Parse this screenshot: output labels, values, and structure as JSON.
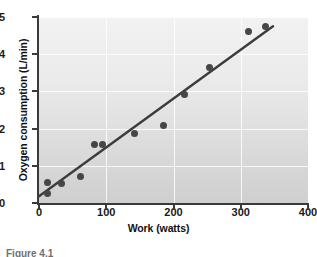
{
  "figure": {
    "caption_fragment": "Figure 4.1"
  },
  "chart_data": {
    "type": "scatter",
    "title": "",
    "xlabel": "Work (watts)",
    "ylabel": "Oxygen consumption (L/min)",
    "xlim": [
      0,
      400
    ],
    "ylim": [
      0,
      5
    ],
    "xticks": [
      0,
      100,
      200,
      300,
      400
    ],
    "yticks": [
      0,
      1,
      2,
      3,
      4,
      5
    ],
    "xtick_labels": [
      "0",
      "100",
      "200",
      "300",
      "400"
    ],
    "ytick_labels": [
      "0",
      "1",
      "2",
      "3",
      "4",
      "5"
    ],
    "grid": true,
    "legend": "none",
    "marker_color": "#464646",
    "line_color": "#3c3c3c",
    "background": "#e6e6e6",
    "x": [
      12,
      13,
      33,
      62,
      82,
      95,
      142,
      185,
      216,
      254,
      311,
      337
    ],
    "y": [
      0.55,
      0.25,
      0.52,
      0.7,
      1.57,
      1.57,
      1.88,
      2.09,
      2.93,
      3.65,
      4.6,
      4.75
    ],
    "series": [
      {
        "name": "Observations",
        "points": [
          {
            "x": 12,
            "y": 0.55
          },
          {
            "x": 13,
            "y": 0.25
          },
          {
            "x": 33,
            "y": 0.52
          },
          {
            "x": 62,
            "y": 0.7
          },
          {
            "x": 82,
            "y": 1.57
          },
          {
            "x": 95,
            "y": 1.57
          },
          {
            "x": 142,
            "y": 1.88
          },
          {
            "x": 185,
            "y": 2.09
          },
          {
            "x": 216,
            "y": 2.93
          },
          {
            "x": 254,
            "y": 3.65
          },
          {
            "x": 311,
            "y": 4.6
          },
          {
            "x": 337,
            "y": 4.75
          }
        ]
      }
    ],
    "trendline": {
      "type": "linear-fit",
      "x_start": 0,
      "y_start": 0.18,
      "x_end": 348,
      "y_end": 4.75
    }
  }
}
